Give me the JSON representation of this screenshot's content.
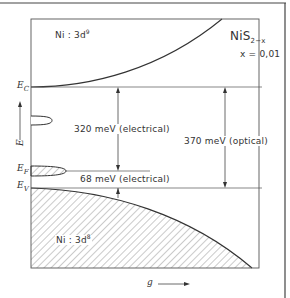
{
  "diagram": {
    "title": {
      "base": "NiS",
      "subscript": "2−x"
    },
    "parameter": "x = 0,01",
    "regions": {
      "upper": {
        "label": "Ni : 3d",
        "superscript": "9"
      },
      "lower": {
        "label": "Ni : 3d",
        "superscript": "8"
      }
    },
    "levels": {
      "conduction": {
        "symbol": "E",
        "subscript": "C"
      },
      "fermi": {
        "symbol": "E",
        "subscript": "F"
      },
      "valence": {
        "symbol": "E",
        "subscript": "V"
      }
    },
    "energy_axis": {
      "symbol": "E"
    },
    "x_axis": {
      "symbol": "g",
      "arrow": "⟶"
    },
    "gaps": [
      {
        "value": "320 meV (electrical)",
        "from": "E_C",
        "to": "E_F"
      },
      {
        "value": "370 meV (optical)",
        "from": "E_C",
        "to": "E_V"
      },
      {
        "value": "68 meV (electrical)",
        "from": "E_F",
        "to": "E_V"
      }
    ],
    "colors": {
      "line": "#333333",
      "hatch": "#555555",
      "background": "#ffffff"
    }
  }
}
